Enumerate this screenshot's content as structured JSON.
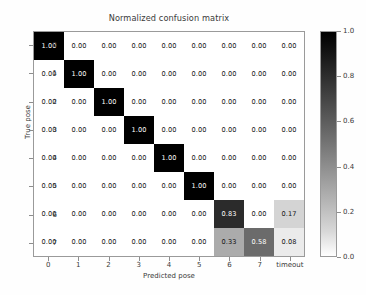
{
  "chart_data": {
    "type": "heatmap",
    "title": "Normalized confusion matrix",
    "xlabel": "Predicted pose",
    "ylabel": "True pose",
    "x_tick_labels": [
      "0",
      "1",
      "2",
      "3",
      "4",
      "5",
      "6",
      "7",
      "timeout"
    ],
    "y_tick_labels": [
      "0",
      "1",
      "2",
      "3",
      "4",
      "5",
      "6",
      "7"
    ],
    "colormap": "gray_reversed",
    "colorbar": {
      "min": 0.0,
      "max": 1.0,
      "tick_labels": [
        "0.0",
        "0.2",
        "0.4",
        "0.6",
        "0.8",
        "1.0"
      ],
      "tick_values": [
        0.0,
        0.2,
        0.4,
        0.6,
        0.8,
        1.0
      ],
      "position": "right",
      "top_color": "#000000",
      "bottom_color": "#ffffff"
    },
    "grid": false,
    "values": [
      [
        1.0,
        0.0,
        0.0,
        0.0,
        0.0,
        0.0,
        0.0,
        0.0,
        0.0
      ],
      [
        0.0,
        1.0,
        0.0,
        0.0,
        0.0,
        0.0,
        0.0,
        0.0,
        0.0
      ],
      [
        0.0,
        0.0,
        1.0,
        0.0,
        0.0,
        0.0,
        0.0,
        0.0,
        0.0
      ],
      [
        0.0,
        0.0,
        0.0,
        1.0,
        0.0,
        0.0,
        0.0,
        0.0,
        0.0
      ],
      [
        0.0,
        0.0,
        0.0,
        0.0,
        1.0,
        0.0,
        0.0,
        0.0,
        0.0
      ],
      [
        0.0,
        0.0,
        0.0,
        0.0,
        0.0,
        1.0,
        0.0,
        0.0,
        0.0
      ],
      [
        0.0,
        0.0,
        0.0,
        0.0,
        0.0,
        0.0,
        0.83,
        0.0,
        0.17
      ],
      [
        0.0,
        0.0,
        0.0,
        0.0,
        0.0,
        0.0,
        0.33,
        0.58,
        0.08
      ]
    ],
    "cell_labels": [
      [
        "1.00",
        "0.00",
        "0.00",
        "0.00",
        "0.00",
        "0.00",
        "0.00",
        "0.00",
        "0.00"
      ],
      [
        "0.00",
        "1.00",
        "0.00",
        "0.00",
        "0.00",
        "0.00",
        "0.00",
        "0.00",
        "0.00"
      ],
      [
        "0.00",
        "0.00",
        "1.00",
        "0.00",
        "0.00",
        "0.00",
        "0.00",
        "0.00",
        "0.00"
      ],
      [
        "0.00",
        "0.00",
        "0.00",
        "1.00",
        "0.00",
        "0.00",
        "0.00",
        "0.00",
        "0.00"
      ],
      [
        "0.00",
        "0.00",
        "0.00",
        "0.00",
        "1.00",
        "0.00",
        "0.00",
        "0.00",
        "0.00"
      ],
      [
        "0.00",
        "0.00",
        "0.00",
        "0.00",
        "0.00",
        "1.00",
        "0.00",
        "0.00",
        "0.00"
      ],
      [
        "0.00",
        "0.00",
        "0.00",
        "0.00",
        "0.00",
        "0.00",
        "0.83",
        "0.00",
        "0.17"
      ],
      [
        "0.00",
        "0.00",
        "0.00",
        "0.00",
        "0.00",
        "0.00",
        "0.33",
        "0.58",
        "0.08"
      ]
    ]
  }
}
